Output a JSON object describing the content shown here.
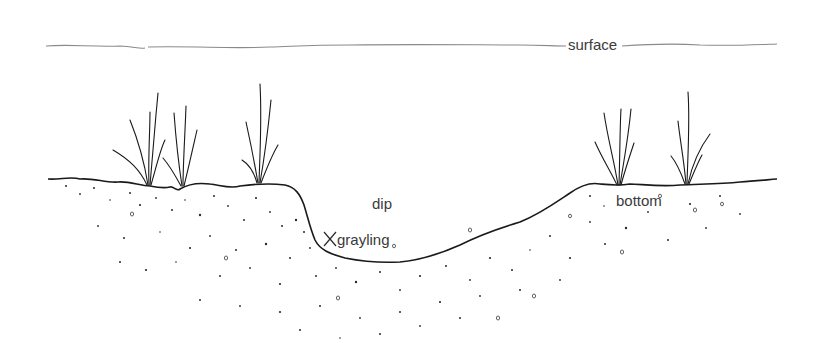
{
  "diagram": {
    "type": "cross-section illustration",
    "labels": {
      "surface": "surface",
      "dip": "dip",
      "grayling": "grayling",
      "bottom": "bottom"
    },
    "markers": [
      {
        "symbol": "X",
        "meaning": "grayling position",
        "location": "lower upstream wall of the dip"
      }
    ],
    "elements": {
      "water_surface_line": "wavy horizontal line near top",
      "stream_bottom": "stippled gravel bed with a U-shaped dip in the middle",
      "weeds": {
        "left_bank_clumps": 3,
        "right_bank_clumps": 2
      }
    },
    "colors": {
      "ink": "#1a1a1a",
      "surface_line": "#8a8a8a",
      "label_text": "#3a3a3a",
      "background": "#ffffff"
    }
  }
}
